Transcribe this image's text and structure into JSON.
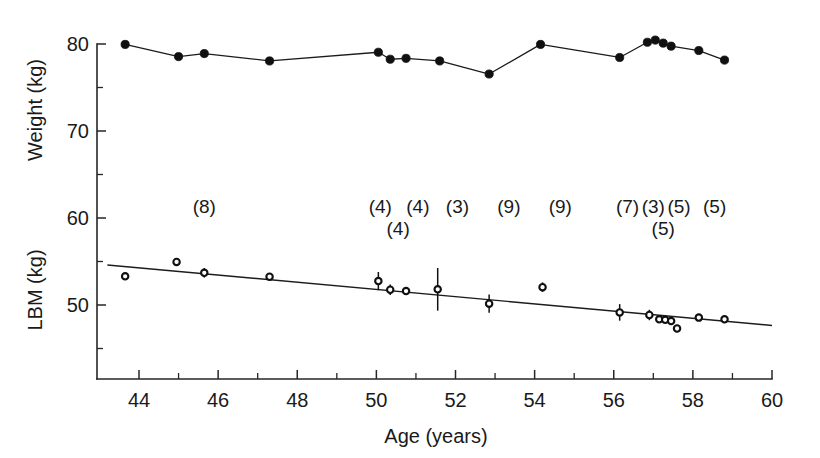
{
  "chart_data": {
    "type": "scatter",
    "title": "",
    "subtitle": "",
    "xlabel": "Age (years)",
    "ylabel_top": "Weight (kg)",
    "ylabel_bottom": "LBM (kg)",
    "xlim": [
      43.0,
      60.0
    ],
    "ylim": [
      44.0,
      81.5
    ],
    "grid": false,
    "legend": "none",
    "x_ticks_major": [
      44,
      46,
      48,
      50,
      52,
      54,
      56,
      58,
      60
    ],
    "x_ticks_major_labels": [
      "44",
      "46",
      "48",
      "50",
      "52",
      "54",
      "56",
      "58",
      "60"
    ],
    "x_ticks_minor": [
      45,
      47,
      49,
      51,
      53,
      55,
      57,
      59
    ],
    "y_ticks_major": [
      50,
      60,
      70,
      80
    ],
    "y_ticks_major_labels": [
      "50",
      "60",
      "70",
      "80"
    ],
    "y_ticks_minor": [
      45,
      55,
      65,
      75
    ],
    "series": [
      {
        "name": "Weight",
        "marker": "filled-circle",
        "connected": true,
        "unit": "kg",
        "points": [
          {
            "x": 43.65,
            "y": 79.95
          },
          {
            "x": 45.0,
            "y": 78.55
          },
          {
            "x": 45.65,
            "y": 78.9
          },
          {
            "x": 47.3,
            "y": 78.05
          },
          {
            "x": 50.05,
            "y": 79.05
          },
          {
            "x": 50.35,
            "y": 78.25
          },
          {
            "x": 50.75,
            "y": 78.35
          },
          {
            "x": 51.6,
            "y": 78.05
          },
          {
            "x": 52.85,
            "y": 76.55
          },
          {
            "x": 54.15,
            "y": 79.95
          },
          {
            "x": 56.15,
            "y": 78.45
          },
          {
            "x": 56.85,
            "y": 80.2
          },
          {
            "x": 57.05,
            "y": 80.45
          },
          {
            "x": 57.25,
            "y": 80.1
          },
          {
            "x": 57.45,
            "y": 79.75
          },
          {
            "x": 58.15,
            "y": 79.25
          },
          {
            "x": 58.8,
            "y": 78.15
          }
        ]
      },
      {
        "name": "LBM",
        "marker": "open-circle",
        "connected": false,
        "unit": "kg",
        "points": [
          {
            "x": 43.65,
            "y": 53.3,
            "err": 0.0
          },
          {
            "x": 44.95,
            "y": 54.95,
            "err": 0.0
          },
          {
            "x": 45.65,
            "y": 53.7,
            "err": 0.55
          },
          {
            "x": 47.3,
            "y": 53.25,
            "err": 0.0
          },
          {
            "x": 50.05,
            "y": 52.75,
            "err": 1.05
          },
          {
            "x": 50.35,
            "y": 51.75,
            "err": 0.6
          },
          {
            "x": 50.75,
            "y": 51.6,
            "err": 0.3
          },
          {
            "x": 51.55,
            "y": 51.8,
            "err": 2.45
          },
          {
            "x": 52.85,
            "y": 50.15,
            "err": 1.05
          },
          {
            "x": 54.2,
            "y": 52.05,
            "err": 0.55
          },
          {
            "x": 56.15,
            "y": 49.15,
            "err": 0.95
          },
          {
            "x": 56.9,
            "y": 48.85,
            "err": 0.6
          },
          {
            "x": 57.15,
            "y": 48.35,
            "err": 0.4
          },
          {
            "x": 57.3,
            "y": 48.3,
            "err": 0.35
          },
          {
            "x": 57.45,
            "y": 48.15,
            "err": 0.45
          },
          {
            "x": 57.6,
            "y": 47.3,
            "err": 0.0
          },
          {
            "x": 58.15,
            "y": 48.55,
            "err": 0.35
          },
          {
            "x": 58.8,
            "y": 48.35,
            "err": 0.0
          }
        ]
      }
    ],
    "fit_line": {
      "name": "LBM regression",
      "x_start": 43.2,
      "y_start": 54.6,
      "x_end": 60.0,
      "y_end": 47.65
    },
    "annotations": [
      {
        "text": "(8)",
        "x": 45.65,
        "y": 60.55,
        "row": 1
      },
      {
        "text": "(4)",
        "x": 50.1,
        "y": 60.55,
        "row": 1
      },
      {
        "text": "(4)",
        "x": 51.05,
        "y": 60.55,
        "row": 1
      },
      {
        "text": "(4)",
        "x": 50.55,
        "y": 58.1,
        "row": 2
      },
      {
        "text": "(3)",
        "x": 52.05,
        "y": 60.55,
        "row": 1
      },
      {
        "text": "(9)",
        "x": 53.35,
        "y": 60.55,
        "row": 1
      },
      {
        "text": "(9)",
        "x": 54.65,
        "y": 60.55,
        "row": 1
      },
      {
        "text": "(7)",
        "x": 56.35,
        "y": 60.55,
        "row": 1
      },
      {
        "text": "(3)",
        "x": 57.0,
        "y": 60.55,
        "row": 1
      },
      {
        "text": "(5)",
        "x": 57.65,
        "y": 60.55,
        "row": 1
      },
      {
        "text": "(5)",
        "x": 57.25,
        "y": 58.1,
        "row": 2
      },
      {
        "text": "(5)",
        "x": 58.55,
        "y": 60.55,
        "row": 1
      }
    ]
  },
  "colors": {
    "ink": "#1a1a1a",
    "marker_fill": "#101010",
    "marker_open_fill": "#ffffff",
    "background": "#ffffff"
  }
}
